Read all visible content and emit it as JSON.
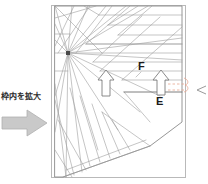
{
  "page": {
    "background_color": "#ffffff",
    "width": 208,
    "height": 184
  },
  "callout": {
    "text": "枠内を拡大",
    "arrow_icon": "right-block-arrow-icon",
    "arrow_fill": "#c9c9c9",
    "arrow_stroke": "#a8a8a8",
    "text_color": "#2b2b2b"
  },
  "figure": {
    "name": "fan-line-engineering-diagram",
    "frame": {
      "x": 51,
      "y": 5,
      "width": 135,
      "height": 173,
      "stroke": "#b5b5b5"
    },
    "outline_stroke": "#8f8f8f",
    "line_stroke": "#9a9a9a",
    "fan_node": {
      "x": 68,
      "y": 53,
      "color": "#4a4a4a"
    },
    "labels": [
      {
        "id": "F",
        "text": "F",
        "x": 138,
        "y": 61
      },
      {
        "id": "E",
        "text": "E",
        "x": 156,
        "y": 96
      }
    ],
    "arrows": [
      {
        "id": "arrow-left",
        "type": "up-arrow-outline",
        "x": 105,
        "y": 72,
        "height": 24
      },
      {
        "id": "arrow-right",
        "type": "up-arrow-outline",
        "x": 160,
        "y": 71,
        "height": 25
      }
    ],
    "dimension_marker": {
      "color": "#e8a08a",
      "style": "dashed",
      "label": "8"
    },
    "edge_marker": {
      "name": "section-arrow-icon",
      "x": 198,
      "y": 88
    }
  }
}
